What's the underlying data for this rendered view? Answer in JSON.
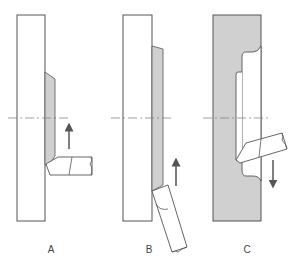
{
  "figure": {
    "type": "turning-operations-diagram",
    "colors": {
      "outline": "#555555",
      "material_fill": "#d0d0d0",
      "background": "#ffffff",
      "centerline": "#777777"
    },
    "panels": [
      {
        "id": "A",
        "label": "A",
        "description": "Facing: tool moves upward removing tapered grey layer from face of workpiece",
        "feed_direction": "up"
      },
      {
        "id": "B",
        "label": "B",
        "description": "Facing with angled tool: tool moves upward removing grey layer",
        "feed_direction": "up"
      },
      {
        "id": "C",
        "label": "C",
        "description": "Boring/internal face: tool moves downward inside a recessed groove of grey workpiece",
        "feed_direction": "down"
      }
    ]
  }
}
